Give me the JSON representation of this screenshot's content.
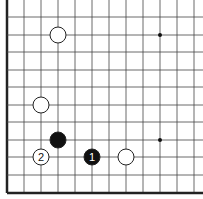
{
  "board": {
    "title": "Go board diagram (lower-left corner)",
    "grid": {
      "x_lines": [
        7,
        24,
        41,
        58,
        75,
        92,
        109,
        126,
        143,
        160,
        177,
        194
      ],
      "y_lines": [
        0,
        17,
        35,
        52,
        70,
        87,
        105,
        122,
        140,
        157,
        175,
        193
      ],
      "edge_left_x": 7,
      "edge_bottom_y": 193,
      "line_color": "#444444",
      "edge_color": "#222222"
    },
    "star_points": [
      {
        "x": 160,
        "y": 35
      },
      {
        "x": 160,
        "y": 140
      }
    ],
    "stones": [
      {
        "color": "white",
        "x": 58,
        "y": 35,
        "label": ""
      },
      {
        "color": "white",
        "x": 41,
        "y": 105,
        "label": ""
      },
      {
        "color": "black",
        "x": 58,
        "y": 140,
        "label": ""
      },
      {
        "color": "white",
        "x": 41,
        "y": 157,
        "label": "2"
      },
      {
        "color": "black",
        "x": 92,
        "y": 157,
        "label": "1"
      },
      {
        "color": "white",
        "x": 126,
        "y": 157,
        "label": ""
      }
    ],
    "stone_radius": 8,
    "colors": {
      "black_stone": "#111111",
      "white_stone": "#ffffff",
      "stone_outline": "#222222"
    }
  }
}
